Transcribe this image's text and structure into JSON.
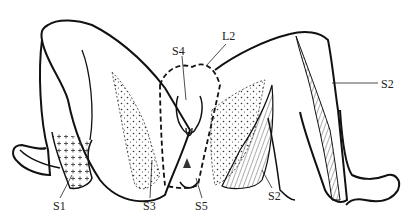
{
  "diagram": {
    "labels": [
      {
        "id": "L2",
        "text": "L2",
        "x": 222,
        "y": 38
      },
      {
        "id": "S4",
        "text": "S4",
        "x": 172,
        "y": 49
      },
      {
        "id": "S2_upper",
        "text": "S2",
        "x": 381,
        "y": 80
      },
      {
        "id": "S1",
        "text": "S1",
        "x": 53,
        "y": 204
      },
      {
        "id": "S3",
        "text": "S3",
        "x": 143,
        "y": 204
      },
      {
        "id": "S5",
        "text": "S5",
        "x": 197,
        "y": 205
      },
      {
        "id": "S2_lower",
        "text": "S2",
        "x": 270,
        "y": 194
      }
    ]
  }
}
